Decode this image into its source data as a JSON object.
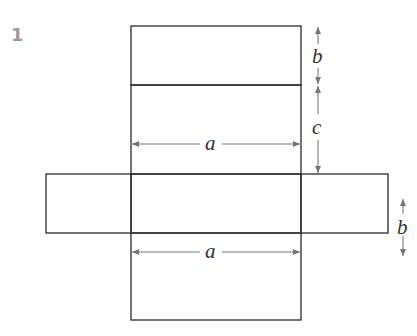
{
  "problem_number": "1",
  "diagram": {
    "type": "net_of_rectangular_prism",
    "colors": {
      "line": "#2a2a2a",
      "arrow": "#777777",
      "label": "#333333",
      "number": "#9a9a9a"
    },
    "labels": {
      "top_height": "b",
      "middle_height": "c",
      "upper_width": "a",
      "side_height": "b",
      "lower_width": "a"
    }
  }
}
